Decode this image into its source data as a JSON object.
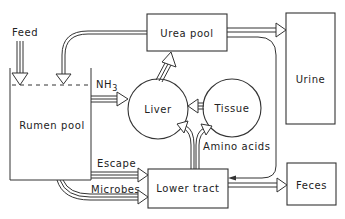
{
  "diagram": {
    "nodes": {
      "feed": {
        "label": "Feed"
      },
      "rumen_pool": {
        "label": "Rumen pool"
      },
      "urea_pool": {
        "label": "Urea pool"
      },
      "urine": {
        "label": "Urine"
      },
      "liver": {
        "label": "Liver"
      },
      "tissue": {
        "label": "Tissue"
      },
      "lower_tract": {
        "label": "Lower tract"
      },
      "feces": {
        "label": "Feces"
      }
    },
    "edge_labels": {
      "nh3_main": "NH",
      "nh3_sub": "3",
      "escape": "Escape",
      "microbes": "Microbes",
      "amino_acids": "Amino acids"
    },
    "edges": [
      {
        "from": "Feed",
        "to": "Rumen pool"
      },
      {
        "from": "Urea pool",
        "to": "Rumen pool"
      },
      {
        "from": "Urea pool",
        "to": "Urine"
      },
      {
        "from": "Urea pool",
        "to": "Lower tract"
      },
      {
        "from": "Rumen pool",
        "to": "Liver",
        "label": "NH3"
      },
      {
        "from": "Liver",
        "to": "Urea pool"
      },
      {
        "from": "Tissue",
        "to": "Liver"
      },
      {
        "from": "Lower tract",
        "to": "Liver",
        "label": "Amino acids"
      },
      {
        "from": "Lower tract",
        "to": "Tissue",
        "label": "Amino acids"
      },
      {
        "from": "Rumen pool",
        "to": "Lower tract",
        "label": "Escape"
      },
      {
        "from": "Rumen pool",
        "to": "Lower tract",
        "label": "Microbes"
      },
      {
        "from": "Lower tract",
        "to": "Feces"
      }
    ]
  }
}
